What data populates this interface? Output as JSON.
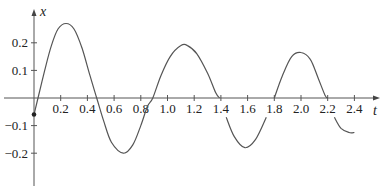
{
  "chart_data": {
    "type": "line",
    "title": "",
    "xlabel": "t",
    "ylabel": "x",
    "xlim": [
      0,
      2.5
    ],
    "ylim": [
      -0.3,
      0.3
    ],
    "grid": false,
    "legend": null,
    "x_ticks": [
      0.2,
      0.4,
      0.6,
      0.8,
      1.0,
      1.2,
      1.4,
      1.6,
      1.8,
      2.0,
      2.2,
      2.4
    ],
    "x_tick_labels": [
      "0.2",
      "0.4",
      "0.6",
      "0.8",
      "1.0",
      "1.2",
      "1.4",
      "1.6",
      "1.8",
      "2.0",
      "2.2",
      "2.4"
    ],
    "y_ticks": [
      0.2,
      0.1,
      -0.1,
      -0.2
    ],
    "y_tick_labels": [
      "0.2",
      "0.1",
      "−0.1",
      "−0.2"
    ],
    "start_point": {
      "t": 0,
      "x": -0.06
    },
    "series": [
      {
        "name": "x(t)",
        "segments": [
          [
            [
              0.0,
              -0.06
            ],
            [
              0.03,
              0.0
            ],
            [
              0.08,
              0.1
            ],
            [
              0.13,
              0.19
            ],
            [
              0.18,
              0.25
            ],
            [
              0.24,
              0.27
            ],
            [
              0.3,
              0.25
            ],
            [
              0.36,
              0.18
            ],
            [
              0.42,
              0.08
            ],
            [
              0.47,
              0.0
            ],
            [
              0.52,
              -0.08
            ],
            [
              0.58,
              -0.16
            ],
            [
              0.67,
              -0.2
            ],
            [
              0.74,
              -0.17
            ],
            [
              0.8,
              -0.1
            ],
            [
              0.85,
              -0.03
            ],
            [
              0.89,
              0.0
            ],
            [
              0.95,
              0.08
            ],
            [
              1.02,
              0.15
            ],
            [
              1.1,
              0.19
            ],
            [
              1.15,
              0.19
            ],
            [
              1.22,
              0.16
            ],
            [
              1.3,
              0.09
            ],
            [
              1.36,
              0.02
            ],
            [
              1.39,
              0.0
            ]
          ],
          [
            [
              1.44,
              -0.07
            ],
            [
              1.5,
              -0.14
            ],
            [
              1.58,
              -0.18
            ],
            [
              1.66,
              -0.15
            ],
            [
              1.74,
              -0.07
            ]
          ],
          [
            [
              1.8,
              0.0
            ],
            [
              1.86,
              0.08
            ],
            [
              1.93,
              0.15
            ],
            [
              2.0,
              0.165
            ],
            [
              2.07,
              0.14
            ],
            [
              2.13,
              0.07
            ],
            [
              2.18,
              0.01
            ],
            [
              2.2,
              0.0
            ]
          ],
          [
            [
              2.25,
              -0.07
            ],
            [
              2.3,
              -0.11
            ],
            [
              2.36,
              -0.125
            ],
            [
              2.4,
              -0.125
            ]
          ]
        ]
      }
    ]
  }
}
